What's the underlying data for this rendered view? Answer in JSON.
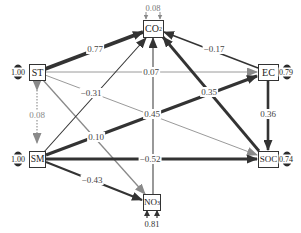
{
  "nodes": {
    "co2": {
      "label": "CO",
      "sub": "2",
      "residual": "0.08"
    },
    "st": {
      "label": "ST",
      "residual": "1.00"
    },
    "ec": {
      "label": "EC",
      "residual": "0.79"
    },
    "sm": {
      "label": "SM",
      "residual": "1.00"
    },
    "soc": {
      "label": "SOC",
      "residual": "0.74"
    },
    "no3": {
      "label": "NO",
      "sub": "3",
      "residual": "0.81"
    }
  },
  "edges": [
    {
      "from": "ST",
      "to": "CO2",
      "coef": "0.77",
      "style": "thick-dark"
    },
    {
      "from": "EC",
      "to": "CO2",
      "coef": "−0.17",
      "style": "dark"
    },
    {
      "from": "ST",
      "to": "EC",
      "coef": "0.07",
      "style": "gray-thin"
    },
    {
      "from": "ST",
      "to": "SOC",
      "coef": "−0.31",
      "style": "gray-thin"
    },
    {
      "from": "ST",
      "to": "NO3",
      "coef": "0.10",
      "style": "gray"
    },
    {
      "from": "SM",
      "to": "ST",
      "coef": "0.08",
      "style": "dotted-gray"
    },
    {
      "from": "SM",
      "to": "CO2",
      "coef": "",
      "style": "dark-thin"
    },
    {
      "from": "NO3",
      "to": "CO2",
      "coef": "0.45",
      "style": "dark-thin"
    },
    {
      "from": "SM",
      "to": "EC",
      "coef": "0.35",
      "style": "thick-dark"
    },
    {
      "from": "SOC",
      "to": "CO2",
      "coef": "",
      "style": "thick-dark"
    },
    {
      "from": "EC",
      "to": "SOC",
      "coef": "0.36",
      "style": "thick-dark"
    },
    {
      "from": "SM",
      "to": "SOC",
      "coef": "−0.52",
      "style": "thick-dark"
    },
    {
      "from": "SM",
      "to": "NO3",
      "coef": "−0.43",
      "style": "dark"
    }
  ],
  "labels": {
    "e_st_co2": "0.77",
    "e_ec_co2": "−0.17",
    "e_st_ec": "0.07",
    "e_st_soc": "−0.31",
    "e_st_no3": "0.10",
    "e_sm_st": "0.08",
    "e_no3_co2": "0.45",
    "e_sm_ec": "0.35",
    "e_ec_soc": "0.36",
    "e_sm_soc": "−0.52",
    "e_sm_no3": "−0.43"
  },
  "colors": {
    "dark": "#333333",
    "gray": "#8a8a8a",
    "light": "#a0a0a0"
  }
}
